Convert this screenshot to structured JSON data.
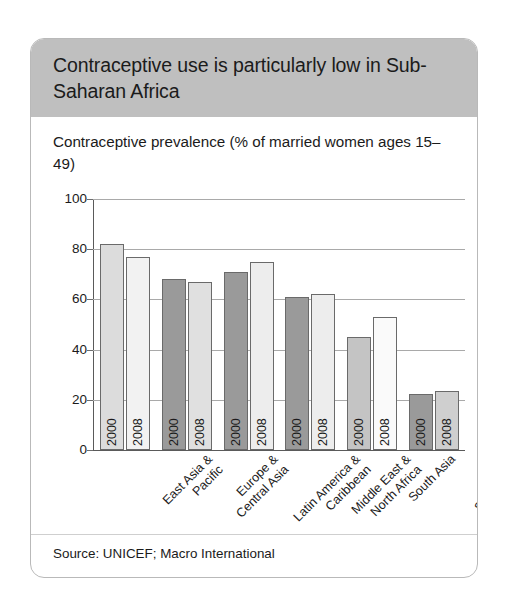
{
  "card": {
    "title": "Contraceptive use is particularly low in Sub-Saharan Africa",
    "subtitle": "Contraceptive prevalence (% of married women ages 15–49)",
    "source": "Source: UNICEF; Macro International",
    "header_color": "#bfbfbf",
    "card_background": "#ffffff",
    "border_color": "#b9b9b9"
  },
  "chart_data": {
    "type": "bar",
    "title": "Contraceptive use is particularly low in Sub-Saharan Africa",
    "subtitle": "Contraceptive prevalence (% of married women ages 15–49)",
    "xlabel": "",
    "ylabel": "",
    "ylim": [
      0,
      100
    ],
    "yticks": [
      0,
      20,
      40,
      60,
      80,
      100
    ],
    "ytick_labels": [
      "0",
      "20",
      "40",
      "60",
      "80",
      "100"
    ],
    "grid": true,
    "legend": "none",
    "bar_value_labels": "none",
    "in_bar_labels": true,
    "categories": [
      "East Asia &\nPacific",
      "Europe &\nCentral Asia",
      "Latin America &\nCaribbean",
      "Middle East &\nNorth Africa",
      "South Asia",
      "Sub-Saharan\nAfrica"
    ],
    "series": [
      {
        "name": "2000",
        "values": [
          82,
          68,
          71,
          61,
          45,
          22.5
        ],
        "colors": [
          "#dcdcdc",
          "#9a9a9a",
          "#9a9a9a",
          "#9a9a9a",
          "#c4c4c4",
          "#9a9a9a"
        ]
      },
      {
        "name": "2008",
        "values": [
          77,
          67,
          75,
          62,
          53,
          23.5
        ],
        "colors": [
          "#f2f2f2",
          "#e0e0e0",
          "#ededed",
          "#ededed",
          "#fafafa",
          "#cfcfcf"
        ]
      }
    ],
    "bars": [
      {
        "category": "East Asia & Pacific",
        "year": "2000",
        "value": 82,
        "fill": "#dcdcdc"
      },
      {
        "category": "East Asia & Pacific",
        "year": "2008",
        "value": 77,
        "fill": "#f2f2f2"
      },
      {
        "category": "Europe & Central Asia",
        "year": "2000",
        "value": 68,
        "fill": "#9a9a9a"
      },
      {
        "category": "Europe & Central Asia",
        "year": "2008",
        "value": 67,
        "fill": "#e0e0e0"
      },
      {
        "category": "Latin America & Caribbean",
        "year": "2000",
        "value": 71,
        "fill": "#9a9a9a"
      },
      {
        "category": "Latin America & Caribbean",
        "year": "2008",
        "value": 75,
        "fill": "#ededed"
      },
      {
        "category": "Middle East & North Africa",
        "year": "2000",
        "value": 61,
        "fill": "#9a9a9a"
      },
      {
        "category": "Middle East & North Africa",
        "year": "2008",
        "value": 62,
        "fill": "#ededed"
      },
      {
        "category": "South Asia",
        "year": "2000",
        "value": 45,
        "fill": "#c4c4c4"
      },
      {
        "category": "South Asia",
        "year": "2008",
        "value": 53,
        "fill": "#fafafa"
      },
      {
        "category": "Sub-Saharan Africa",
        "year": "2000",
        "value": 22.5,
        "fill": "#9a9a9a"
      },
      {
        "category": "Sub-Saharan Africa",
        "year": "2008",
        "value": 23.5,
        "fill": "#cfcfcf"
      }
    ]
  }
}
